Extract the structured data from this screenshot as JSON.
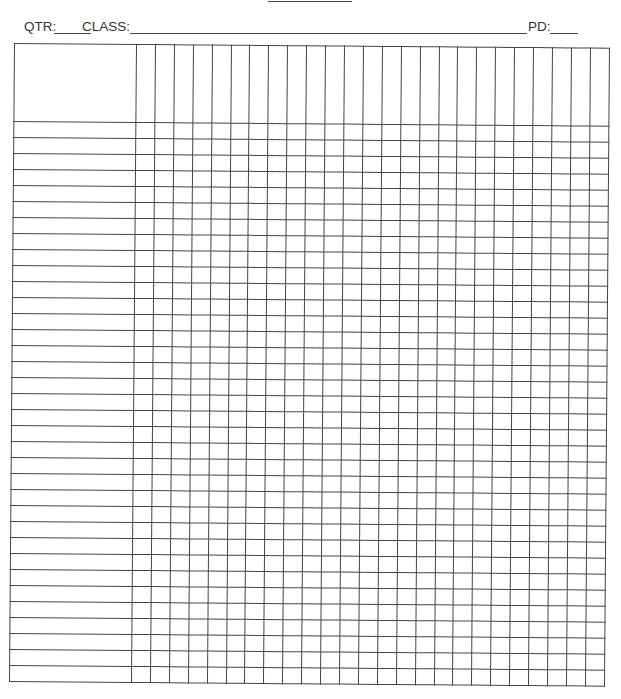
{
  "document": {
    "type": "grade-sheet",
    "title_underline": true,
    "header": {
      "qtr_label": "QTR:",
      "qtr_value": "",
      "class_label": "CLASS:",
      "class_value": "",
      "pd_label": "PD:",
      "pd_value": ""
    },
    "grid": {
      "name_column_header": "",
      "data_columns": 25,
      "rows": 35,
      "line_color": "#444444"
    }
  }
}
